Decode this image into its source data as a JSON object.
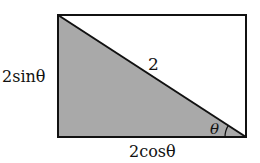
{
  "diagram": {
    "type": "right-triangle-in-rectangle",
    "rectangle": {
      "x": 58,
      "y": 15,
      "width": 188,
      "height": 122
    },
    "shaded_region": "lower-left triangle",
    "colors": {
      "shade": "#a9a9a9",
      "stroke": "#111111",
      "background": "#ffffff"
    },
    "labels": {
      "hypotenuse": "2",
      "vertical_side": "2sinθ",
      "horizontal_side": "2cosθ",
      "angle": "θ"
    }
  }
}
